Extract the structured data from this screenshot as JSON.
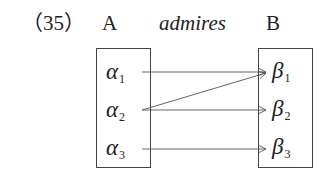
{
  "diagram": {
    "number": "（35）",
    "set_a_label": "A",
    "relation_label": "admires",
    "set_b_label": "B",
    "set_a": [
      {
        "symbol": "α",
        "sub": "1"
      },
      {
        "symbol": "α",
        "sub": "2"
      },
      {
        "symbol": "α",
        "sub": "3"
      }
    ],
    "set_b": [
      {
        "symbol": "β",
        "sub": "1"
      },
      {
        "symbol": "β",
        "sub": "2"
      },
      {
        "symbol": "β",
        "sub": "3"
      }
    ],
    "mappings": [
      {
        "from": "α1",
        "to": "β1"
      },
      {
        "from": "α2",
        "to": "β1"
      },
      {
        "from": "α2",
        "to": "β2"
      },
      {
        "from": "α3",
        "to": "β3"
      }
    ],
    "colors": {
      "line": "#555555",
      "text": "#222222"
    }
  }
}
